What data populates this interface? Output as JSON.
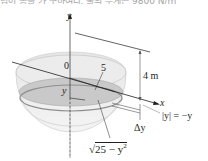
{
  "header": {
    "cropped_text": "넘어 동을 가 구하여라. 물의 무게는 9800 N/m"
  },
  "diagram": {
    "axes": {
      "y_label": "y",
      "x_label": "x",
      "origin_label": "0"
    },
    "labels": {
      "radius": "5",
      "depth": "4 m",
      "slice_y": "y",
      "slice_thickness": "Δy",
      "distance": "|y| = −y",
      "slice_radius": "√25 − y²",
      "slice_radius_radicand": "25 − y",
      "slice_radius_exp": "2",
      "sqrt_sign": "√"
    },
    "colors": {
      "line": "#231f20",
      "tank_fill": "#d9d9d9",
      "water_fill": "#bdbdbd",
      "slice_fill": "#9a9a9a"
    }
  }
}
